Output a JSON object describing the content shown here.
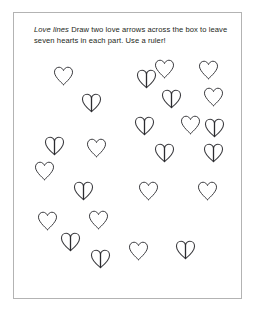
{
  "page": {
    "frame_border_color": "#b3b3b3",
    "background_color": "#ffffff",
    "ink_color": "#3b3b3f"
  },
  "instruction": {
    "title": "Love lines",
    "body": " Draw two love arrows across the box to leave seven hearts in each part. Use a ruler!",
    "full_text": "Love lines Draw two love arrows across the box to leave seven hearts in each part. Use a ruler!"
  },
  "hearts": {
    "total_count": 21,
    "plain_count": 11,
    "creased_count": 10,
    "items": [
      {
        "id": "heart-1",
        "style": "plain",
        "x": 39,
        "y": 53,
        "size": 21,
        "label": "heart"
      },
      {
        "id": "heart-2",
        "style": "creased",
        "x": 122,
        "y": 56,
        "size": 21,
        "label": "heart-creased"
      },
      {
        "id": "heart-3",
        "style": "plain",
        "x": 140,
        "y": 46,
        "size": 21,
        "label": "heart"
      },
      {
        "id": "heart-4",
        "style": "plain",
        "x": 184,
        "y": 47,
        "size": 21,
        "label": "heart"
      },
      {
        "id": "heart-5",
        "style": "creased",
        "x": 67,
        "y": 80,
        "size": 21,
        "label": "heart-creased"
      },
      {
        "id": "heart-6",
        "style": "creased",
        "x": 147,
        "y": 76,
        "size": 21,
        "label": "heart-creased"
      },
      {
        "id": "heart-7",
        "style": "plain",
        "x": 189,
        "y": 74,
        "size": 21,
        "label": "heart"
      },
      {
        "id": "heart-8",
        "style": "plain",
        "x": 166,
        "y": 102,
        "size": 21,
        "label": "heart"
      },
      {
        "id": "heart-9",
        "style": "creased",
        "x": 190,
        "y": 105,
        "size": 21,
        "label": "heart-creased"
      },
      {
        "id": "heart-10",
        "style": "creased",
        "x": 120,
        "y": 103,
        "size": 21,
        "label": "heart-creased"
      },
      {
        "id": "heart-11",
        "style": "creased",
        "x": 30,
        "y": 123,
        "size": 21,
        "label": "heart-creased"
      },
      {
        "id": "heart-12",
        "style": "plain",
        "x": 72,
        "y": 125,
        "size": 21,
        "label": "heart"
      },
      {
        "id": "heart-13",
        "style": "creased",
        "x": 140,
        "y": 130,
        "size": 21,
        "label": "heart-creased"
      },
      {
        "id": "heart-14",
        "style": "creased",
        "x": 189,
        "y": 130,
        "size": 21,
        "label": "heart-creased"
      },
      {
        "id": "heart-15",
        "style": "plain",
        "x": 20,
        "y": 148,
        "size": 21,
        "label": "heart"
      },
      {
        "id": "heart-16",
        "style": "creased",
        "x": 59,
        "y": 168,
        "size": 21,
        "label": "heart-creased"
      },
      {
        "id": "heart-17",
        "style": "plain",
        "x": 124,
        "y": 168,
        "size": 21,
        "label": "heart"
      },
      {
        "id": "heart-18",
        "style": "plain",
        "x": 183,
        "y": 168,
        "size": 21,
        "label": "heart"
      },
      {
        "id": "heart-19",
        "style": "plain",
        "x": 23,
        "y": 198,
        "size": 21,
        "label": "heart"
      },
      {
        "id": "heart-20",
        "style": "plain",
        "x": 74,
        "y": 197,
        "size": 21,
        "label": "heart"
      },
      {
        "id": "heart-21",
        "style": "creased",
        "x": 46,
        "y": 219,
        "size": 21,
        "label": "heart-creased"
      },
      {
        "id": "heart-22",
        "style": "creased",
        "x": 76,
        "y": 236,
        "size": 21,
        "label": "heart-creased"
      },
      {
        "id": "heart-23",
        "style": "plain",
        "x": 114,
        "y": 228,
        "size": 21,
        "label": "heart"
      },
      {
        "id": "heart-24",
        "style": "creased",
        "x": 161,
        "y": 227,
        "size": 21,
        "label": "heart-creased"
      }
    ]
  }
}
